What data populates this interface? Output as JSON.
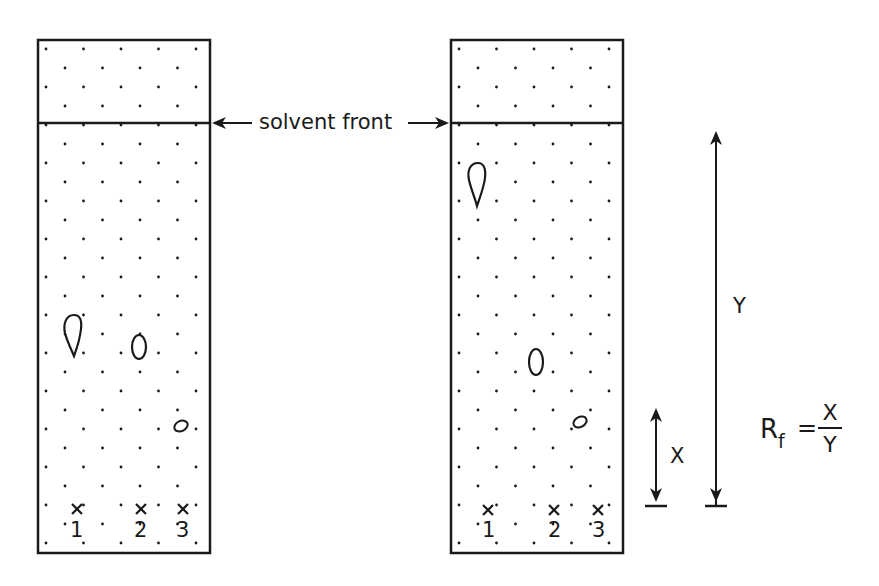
{
  "diagram": {
    "solvent_front_label": "solvent front",
    "plates": [
      {
        "id": "left",
        "lanes": [
          "1",
          "2",
          "3"
        ],
        "spots": [
          {
            "lane": "1",
            "shape": "teardrop",
            "x": 72,
            "y": 333
          },
          {
            "lane": "2",
            "shape": "ellipse",
            "x": 139,
            "y": 347
          },
          {
            "lane": "3",
            "shape": "small-ellipse",
            "x": 181,
            "y": 426
          }
        ]
      },
      {
        "id": "right",
        "lanes": [
          "1",
          "2",
          "3"
        ],
        "spots": [
          {
            "lane": "1",
            "shape": "teardrop",
            "x": 477,
            "y": 177
          },
          {
            "lane": "2",
            "shape": "ellipse",
            "x": 536,
            "y": 362
          },
          {
            "lane": "3",
            "shape": "small-ellipse",
            "x": 580,
            "y": 422
          }
        ]
      }
    ],
    "measurements": {
      "x_label": "X",
      "y_label": "Y",
      "x_description": "distance travelled by spot",
      "y_description": "distance travelled by solvent front"
    },
    "formula": {
      "lhs": "R",
      "lhs_subscript": "f",
      "equals": "=",
      "numerator": "X",
      "denominator": "Y"
    },
    "colors": {
      "ink": "#1a1a1a",
      "background": "#ffffff"
    }
  }
}
